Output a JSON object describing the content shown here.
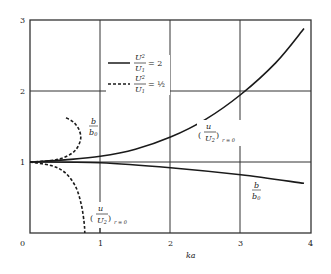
{
  "chart_data": {
    "type": "line",
    "title": "",
    "xlabel": "ka",
    "ylabel": "",
    "xlim": [
      0,
      4
    ],
    "ylim": [
      0,
      3
    ],
    "grid": true,
    "x_ticks": [
      "0",
      "1",
      "2",
      "3",
      "4"
    ],
    "y_ticks": [
      "1",
      "2",
      "3"
    ],
    "legend": {
      "position": "upper-left-inside",
      "entries": [
        {
          "style": "solid",
          "label": "U2/U1 = 2",
          "num": "U",
          "num_sub": "2",
          "den": "U",
          "den_sub": "1",
          "eq": "= 2"
        },
        {
          "style": "dashed",
          "label": "U2/U1 = 1/2",
          "num": "U",
          "num_sub": "2",
          "den": "U",
          "den_sub": "1",
          "eq": "= ½"
        }
      ]
    },
    "series": [
      {
        "name": "(u/U2)_{r=0}, U2/U1=2",
        "style": "solid",
        "x": [
          0,
          0.5,
          1,
          1.5,
          2,
          2.5,
          3,
          3.5,
          3.9
        ],
        "y": [
          1,
          1.03,
          1.08,
          1.18,
          1.35,
          1.6,
          1.95,
          2.4,
          2.88
        ]
      },
      {
        "name": "b/b0, U2/U1=2",
        "style": "solid",
        "x": [
          0,
          1,
          2,
          3,
          3.9
        ],
        "y": [
          1,
          0.99,
          0.92,
          0.82,
          0.7
        ]
      },
      {
        "name": "b/b0, U2/U1=1/2",
        "style": "dashed",
        "x": [
          0,
          0.3,
          0.5,
          0.65,
          0.72,
          0.7,
          0.62,
          0.5
        ],
        "y": [
          1,
          1.02,
          1.07,
          1.17,
          1.32,
          1.45,
          1.56,
          1.63
        ]
      },
      {
        "name": "(u/U2)_{r=0}, U2/U1=1/2",
        "style": "dashed",
        "x": [
          0,
          0.3,
          0.5,
          0.65,
          0.73,
          0.77,
          0.78
        ],
        "y": [
          1,
          0.95,
          0.85,
          0.65,
          0.4,
          0.15,
          0
        ]
      }
    ],
    "annotations": [
      {
        "text": "(u/U2)_{r=0}",
        "near": "upper solid curve",
        "x": 2.45,
        "y": 1.3
      },
      {
        "text": "b/b0",
        "near": "lower solid curve",
        "x": 3.15,
        "y": 0.6
      },
      {
        "text": "b/b0",
        "near": "upper dashed curve",
        "x": 0.75,
        "y": 1.65
      },
      {
        "text": "(u/U2)_{r=0}",
        "near": "lower dashed curve",
        "x": 0.9,
        "y": 0.35
      }
    ]
  },
  "labels": {
    "x_axis": "ka",
    "origin": "0",
    "ann_u": "u",
    "ann_U": "U",
    "ann_U_sub": "2",
    "ann_r_sub": "r = 0",
    "ann_b": "b",
    "ann_b0": "b",
    "ann_b0_sub": "0"
  },
  "colors": {
    "line": "#1a1a1a",
    "grid": "#333333",
    "background": "#ffffff"
  }
}
